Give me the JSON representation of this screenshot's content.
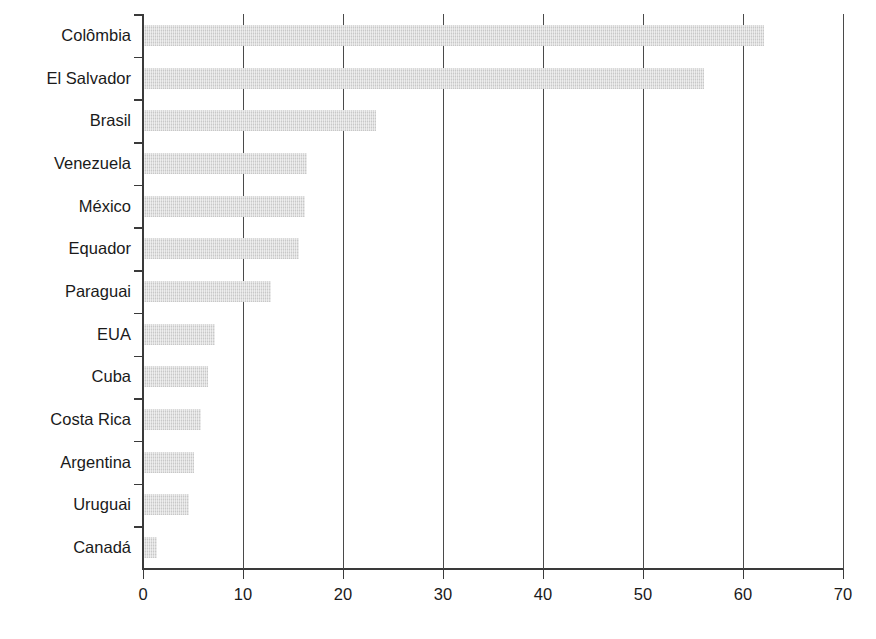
{
  "chart_data": {
    "type": "bar",
    "orientation": "horizontal",
    "title": "",
    "subtitle": "",
    "xlabel": "",
    "ylabel": "",
    "categories": [
      "Colômbia",
      "El Salvador",
      "Brasil",
      "Venezuela",
      "México",
      "Equador",
      "Paraguai",
      "EUA",
      "Cuba",
      "Costa Rica",
      "Argentina",
      "Uruguai",
      "Canadá"
    ],
    "values": [
      62.0,
      56.0,
      23.2,
      16.3,
      16.1,
      15.5,
      12.7,
      7.1,
      6.4,
      5.7,
      5.0,
      4.5,
      1.3
    ],
    "xlim": [
      0,
      70
    ],
    "xticks": [
      0,
      10,
      20,
      30,
      40,
      50,
      60,
      70
    ],
    "xtick_labels": [
      "0",
      "10",
      "20",
      "30",
      "40",
      "50",
      "60",
      "70"
    ],
    "grid": "vertical",
    "legend": null,
    "bar_color": "#d9d9d9",
    "axis_color": "#3a3a3a",
    "text_color": "#1a1a1a",
    "background": "#ffffff"
  }
}
